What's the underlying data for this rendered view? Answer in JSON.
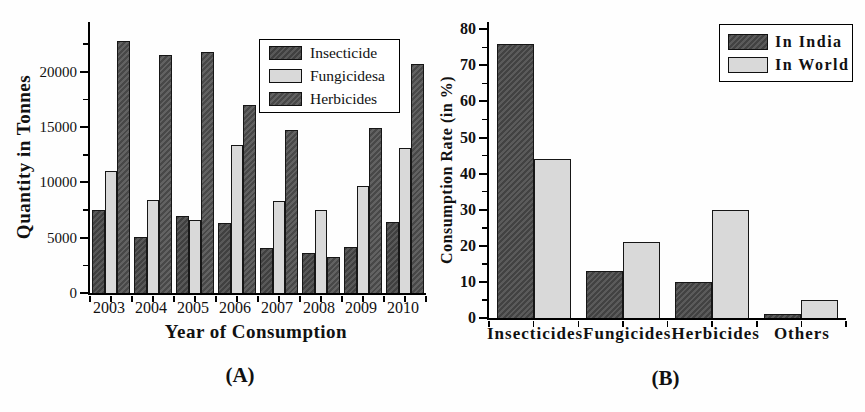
{
  "figure": {
    "background": "#ffffff",
    "axis_color": "#000000"
  },
  "chart_data": [
    {
      "id": "A",
      "type": "bar",
      "panel_label": "(A)",
      "title": "",
      "xlabel": "Year of Consumption",
      "ylabel": "Quantity in Tonnes",
      "categories": [
        "2003",
        "2004",
        "2005",
        "2006",
        "2007",
        "2008",
        "2009",
        "2010"
      ],
      "series": [
        {
          "name": "Insecticide",
          "color": "#505050",
          "hatch": true,
          "values": [
            7500,
            5100,
            7000,
            6300,
            4100,
            3600,
            4200,
            6400
          ]
        },
        {
          "name": "Fungicidesa",
          "color": "#d9d9d9",
          "hatch": false,
          "values": [
            11000,
            8400,
            6600,
            13400,
            8300,
            7500,
            9700,
            13100
          ]
        },
        {
          "name": "Herbicides",
          "color": "#5a5a5a",
          "hatch": true,
          "values": [
            22800,
            21500,
            21800,
            17000,
            14700,
            3300,
            14900,
            20700
          ]
        }
      ],
      "ylim": [
        0,
        24500
      ],
      "yticks": [
        0,
        5000,
        10000,
        15000,
        20000
      ],
      "y_minor_step": 2500,
      "grid": false,
      "legend_position": "inside-top-right"
    },
    {
      "id": "B",
      "type": "bar",
      "panel_label": "(B)",
      "title": "",
      "xlabel": "",
      "ylabel": "Consumption Rate (in %)",
      "categories": [
        "Insecticides",
        "Fungicides",
        "Herbicides",
        "Others"
      ],
      "series": [
        {
          "name": "In India",
          "color": "#525252",
          "hatch": true,
          "values": [
            76,
            13,
            10,
            1
          ]
        },
        {
          "name": "In World",
          "color": "#d9d9d9",
          "hatch": false,
          "values": [
            44,
            21,
            30,
            5
          ]
        }
      ],
      "ylim": [
        0,
        82
      ],
      "yticks": [
        0,
        10,
        20,
        30,
        40,
        50,
        60,
        70,
        80
      ],
      "y_minor_step": 5,
      "grid": false,
      "legend_position": "inside-top-right"
    }
  ]
}
